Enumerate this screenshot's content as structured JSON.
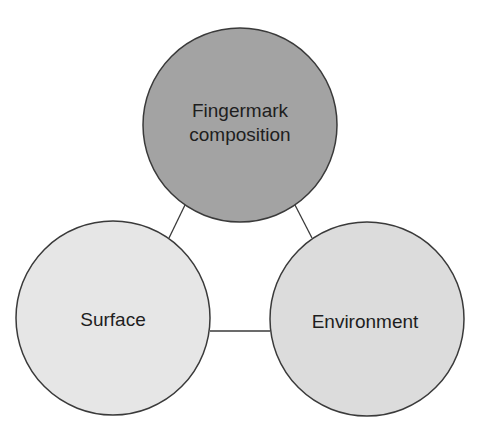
{
  "diagram": {
    "type": "venn-style relationship triangle",
    "nodes": [
      {
        "id": "fingermark",
        "label_lines": [
          "Fingermark",
          "composition"
        ],
        "cx": 240,
        "cy": 125,
        "r": 97,
        "fill": "#a3a3a3"
      },
      {
        "id": "surface",
        "label_lines": [
          "Surface"
        ],
        "cx": 113,
        "cy": 318,
        "r": 97,
        "fill": "#e6e6e6"
      },
      {
        "id": "environment",
        "label_lines": [
          "Environment"
        ],
        "cx": 367,
        "cy": 319,
        "r": 97,
        "fill": "#dcdcdc"
      }
    ],
    "edges": [
      {
        "from": "fingermark",
        "to": "surface"
      },
      {
        "from": "fingermark",
        "to": "environment"
      },
      {
        "from": "surface",
        "to": "environment"
      }
    ],
    "stroke_color": "#3a3a3a",
    "edge_color": "#3a3a3a"
  }
}
